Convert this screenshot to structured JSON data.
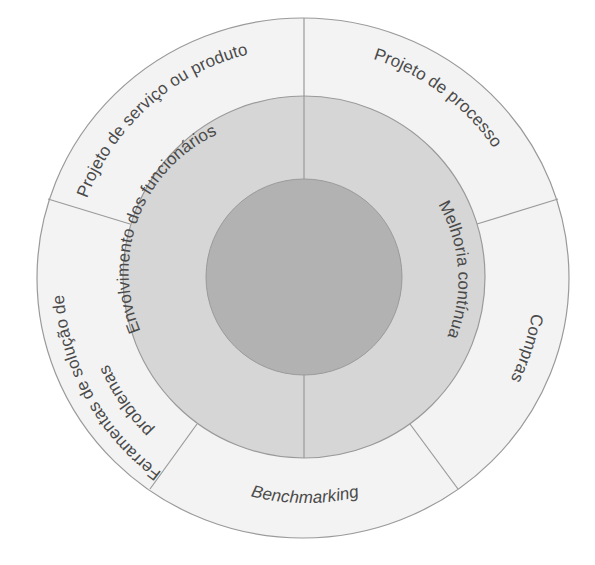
{
  "diagram": {
    "colors": {
      "outer_ring": "#f3f3f3",
      "middle_ring": "#d6d6d6",
      "inner_circle": "#b2b2b2",
      "stroke": "#9a9a9a",
      "text": "#4a4a4a",
      "background": "#ffffff"
    },
    "inner_circle": {
      "label": ""
    },
    "middle_ring": {
      "segments": [
        {
          "label": "Envolvimento dos funcionários"
        },
        {
          "label": "Melhoria contínua"
        }
      ]
    },
    "outer_ring": {
      "segments": [
        {
          "label": "Projeto de serviço ou produto"
        },
        {
          "label": "Projeto de processo"
        },
        {
          "label": "Compras"
        },
        {
          "label": "Benchmarking"
        },
        {
          "label_line1": "Ferramentas de solução de",
          "label_line2": "problemas"
        }
      ]
    }
  }
}
